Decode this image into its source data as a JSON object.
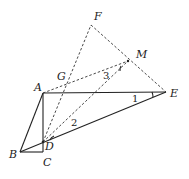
{
  "diagram": {
    "points": {
      "A": {
        "x": 43,
        "y": 93,
        "lx": 34,
        "ly": 91
      },
      "B": {
        "x": 20,
        "y": 152,
        "lx": 9,
        "ly": 158
      },
      "C": {
        "x": 43,
        "y": 152,
        "lx": 43,
        "ly": 166
      },
      "D": {
        "x": 43,
        "y": 142,
        "lx": 45,
        "ly": 150
      },
      "E": {
        "x": 166,
        "y": 92,
        "lx": 170,
        "ly": 97
      },
      "F": {
        "x": 91,
        "y": 25,
        "lx": 94,
        "ly": 20
      },
      "G": {
        "x": 66,
        "y": 82,
        "lx": 57,
        "ly": 80
      },
      "M": {
        "x": 128,
        "y": 61,
        "lx": 136,
        "ly": 58
      }
    },
    "labels": {
      "A": "A",
      "B": "B",
      "C": "C",
      "D": "D",
      "E": "E",
      "F": "F",
      "G": "G",
      "M": "M"
    },
    "angle_labels": {
      "one": "1",
      "two": "2",
      "three": "3"
    },
    "solid_segments": [
      "AE",
      "AB",
      "AC",
      "BC",
      "BE"
    ],
    "dashed_segments": [
      "DF",
      "FE",
      "AM",
      "DM"
    ]
  }
}
